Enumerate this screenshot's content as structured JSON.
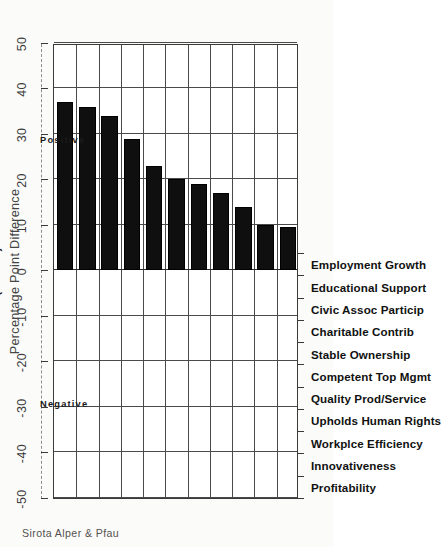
{
  "chart_data": {
    "type": "bar",
    "title": "",
    "subtitle": "",
    "xlabel": "",
    "ylabel": "Percentage Point Difference",
    "continuation_note": "(Cont'd)",
    "orientation": "vertical-bars-on-rotated-page",
    "grid": true,
    "legend": "none",
    "ylim": [
      -50,
      50
    ],
    "ytick_labels": [
      "-50",
      "-40",
      "-30",
      "-20",
      "-10",
      "0",
      "10",
      "20",
      "30",
      "40",
      "50"
    ],
    "ytick_values": [
      -50,
      -40,
      -30,
      -20,
      -10,
      0,
      10,
      20,
      30,
      40,
      50
    ],
    "categories": [
      "Profitability",
      "Innovativeness",
      "Workplce Efficiency",
      "Upholds Human Rights",
      "Quality Prod/Service",
      "Competent Top Mgmt",
      "Stable Ownership",
      "Charitable Contrib",
      "Civic Assoc Particip",
      "Educational Support",
      "Employment Growth"
    ],
    "values": [
      37,
      36,
      34,
      29,
      23,
      20,
      19,
      17,
      14,
      10,
      9.5
    ],
    "bar_color": "#100f0f",
    "region_labels": {
      "positive": "Positive",
      "negative": "Negative"
    }
  },
  "footer": {
    "credit": "Sirota Alper & Pfau"
  }
}
